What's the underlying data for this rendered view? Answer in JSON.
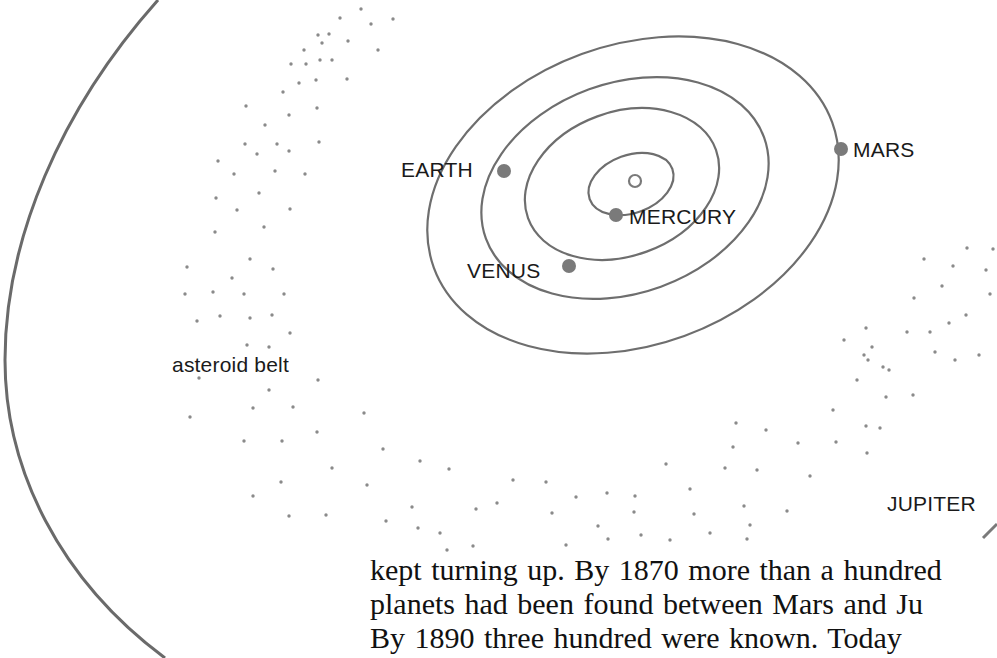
{
  "diagram": {
    "colors": {
      "orbit": "#6e6e6e",
      "planet": "#7a7a7a",
      "asteroid": "#8a8a8a",
      "text": "#1a1a1a"
    },
    "labels": {
      "earth": "EARTH",
      "mars": "MARS",
      "mercury": "MERCURY",
      "venus": "VENUS",
      "asteroid_belt": "asteroid belt",
      "jupiter": "JUPITER"
    }
  },
  "body_text": {
    "lines": [
      "kept turning up. By 1870 more than a hundred",
      "planets had been found between Mars and Ju",
      "By 1890 three hundred were known. Today"
    ]
  }
}
